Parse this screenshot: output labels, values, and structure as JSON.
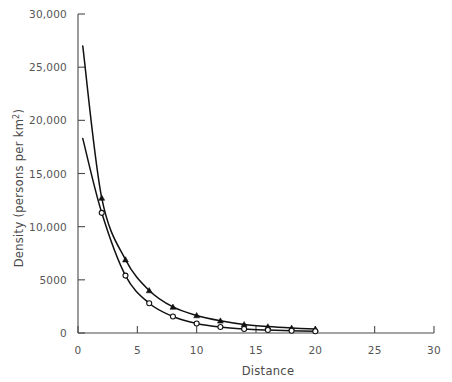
{
  "chart_data": {
    "type": "line",
    "title": "",
    "xlabel": "Distance",
    "ylabel": "Density (persons per km",
    "ylabel_superscript": "2",
    "ylabel_suffix": ")",
    "xlim": [
      0,
      30
    ],
    "ylim": [
      0,
      30000
    ],
    "grid": false,
    "legend": "none",
    "xticks": [
      0,
      5,
      10,
      15,
      20,
      25,
      30
    ],
    "xtick_labels": [
      "0",
      "5",
      "10",
      "15",
      "20",
      "25",
      "30"
    ],
    "yticks": [
      0,
      5000,
      10000,
      15000,
      20000,
      25000,
      30000
    ],
    "ytick_labels": [
      "0",
      "5000",
      "10,000",
      "15,000",
      "20,000",
      "25,000",
      "30,000"
    ],
    "series": [
      {
        "name": "steep-curve",
        "marker": "triangle",
        "x": [
          0.4,
          2,
          4,
          6,
          8,
          10,
          12,
          14,
          16,
          18,
          20
        ],
        "values": [
          27000,
          12700,
          6900,
          4000,
          2450,
          1650,
          1150,
          800,
          600,
          470,
          380
        ]
      },
      {
        "name": "shallow-curve",
        "marker": "circle",
        "x": [
          0.4,
          2,
          4,
          6,
          8,
          10,
          12,
          14,
          16,
          18,
          20
        ],
        "values": [
          18300,
          11300,
          5400,
          2800,
          1550,
          900,
          560,
          380,
          280,
          210,
          170
        ]
      }
    ]
  },
  "colors": {
    "curve": "#111111",
    "axis": "#4a4a4a",
    "label": "#555555",
    "background": "#ffffff"
  }
}
